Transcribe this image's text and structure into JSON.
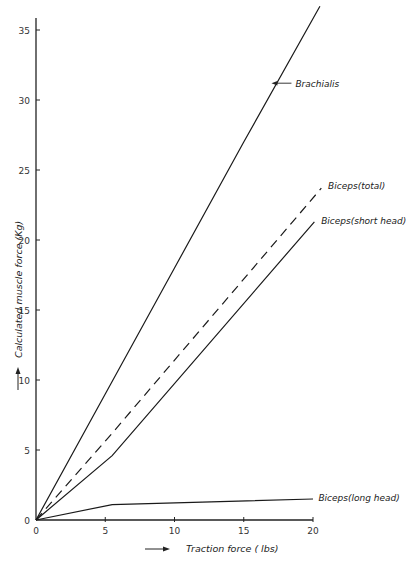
{
  "chart_data": {
    "type": "line",
    "title": "",
    "xlabel": "Traction force ( lbs)",
    "ylabel": "Calculated muscle force (Kg)",
    "xlim": [
      0,
      20
    ],
    "ylim": [
      0,
      36
    ],
    "xticks": [
      0,
      5,
      10,
      15,
      20
    ],
    "yticks": [
      0,
      5,
      10,
      15,
      20,
      25,
      30,
      35
    ],
    "grid": false,
    "legend": "inline labels at line ends",
    "series": [
      {
        "name": "Brachialis",
        "style": "solid",
        "x": [
          0,
          5,
          10,
          15,
          20.5
        ],
        "y": [
          0,
          9,
          18,
          27,
          36.7
        ],
        "label_at": [
          17,
          31.2
        ],
        "label_arrow": true
      },
      {
        "name": "Biceps(total)",
        "style": "dashed",
        "x": [
          0,
          5.5,
          20.6
        ],
        "y": [
          0,
          6.2,
          23.7
        ],
        "label_at": [
          20.8,
          23.8
        ]
      },
      {
        "name": "Biceps(short head)",
        "style": "solid",
        "x": [
          0,
          5.5,
          20.1
        ],
        "y": [
          0,
          4.6,
          21.3
        ],
        "label_at": [
          20.3,
          21.3
        ]
      },
      {
        "name": "Biceps(long head)",
        "style": "solid",
        "x": [
          0,
          5.5,
          20
        ],
        "y": [
          0,
          1.1,
          1.5
        ],
        "label_at": [
          20.1,
          1.5
        ]
      }
    ]
  },
  "labels": {
    "x_axis_title": "Traction force ( lbs)",
    "y_axis_title": "Calculated muscle force (Kg)",
    "y_origin_label": "0"
  }
}
